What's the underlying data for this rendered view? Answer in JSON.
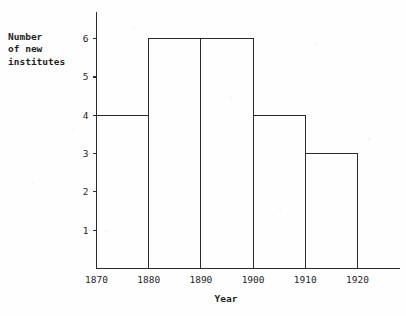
{
  "chart_data": {
    "type": "bar",
    "title": "",
    "subtitle": "",
    "xlabel": "Year",
    "ylabel": "Number of new institutes",
    "ylabel_lines": [
      "Number",
      "of new",
      "institutes"
    ],
    "categories": [
      "1870-1880",
      "1880-1890",
      "1890-1900",
      "1900-1910",
      "1910-1920"
    ],
    "bin_edges": [
      1870,
      1880,
      1890,
      1900,
      1910,
      1920
    ],
    "values": [
      4,
      6,
      6,
      4,
      3
    ],
    "x": [
      1870,
      1880,
      1890,
      1900,
      1910,
      1920
    ],
    "xtick_labels": [
      "1870",
      "1880",
      "1890",
      "1900",
      "1910",
      "1920"
    ],
    "ytick_labels": [
      "1",
      "2",
      "3",
      "4",
      "5",
      "6"
    ],
    "ytick_values": [
      1,
      2,
      3,
      4,
      5,
      6
    ],
    "xlim": [
      1870,
      1920
    ],
    "ylim": [
      0,
      6
    ],
    "grid": false,
    "legend": false,
    "legend_position": "none",
    "bar_fill": "none",
    "bar_stroke": "#2b2b2b",
    "style": "histogram-outline"
  },
  "axes": {
    "x_title": "Year",
    "y_title_line1": "Number",
    "y_title_line2": "of new",
    "y_title_line3": "institutes"
  },
  "colors": {
    "ink": "#2b2b2b",
    "text": "#1f1f1f",
    "background": "#fefefe"
  }
}
